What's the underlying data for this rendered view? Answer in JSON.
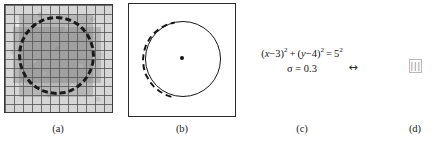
{
  "figure": {
    "panels": [
      {
        "id": "a",
        "caption": "(a)",
        "description": "noisy grayscale grid image with dashed circle overlay"
      },
      {
        "id": "b",
        "caption": "(b)",
        "description": "white box with solid circle, partial dashed arc and center dot"
      },
      {
        "id": "c",
        "caption": "(c)",
        "equation_main_parts": {
          "open": "(",
          "x": "x",
          "minus_a": "−3",
          "close_sq1": ")",
          "exp1": "2",
          "plus": " + ",
          "open2": "(",
          "y": "y",
          "minus_b": "−4",
          "close_sq2": ")",
          "exp2": "2",
          "equals": " = 5",
          "exp3": "2"
        },
        "equation_main_text": "(x−3)² + (y−4)² = 5²",
        "equation_sigma": "σ = 0.3"
      },
      {
        "id": "d",
        "caption": "(d)",
        "glyph": "|||"
      }
    ],
    "connector": {
      "symbol": "↔",
      "name": "double-headed-arrow"
    },
    "colors": {
      "ink": "#141414",
      "panel_border": "#2b2b2b",
      "grid_line": "#5a5a5a",
      "grid_fill": "#d6d6d6",
      "shade": "#6e6e6e",
      "faint_glyph": "#8e8e8e",
      "background": "#ffffff"
    }
  }
}
